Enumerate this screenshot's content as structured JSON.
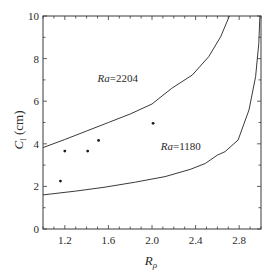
{
  "chart_data": {
    "type": "line",
    "title": "",
    "xlabel": "R_ρ",
    "xlabel_main": "R",
    "xlabel_sub": "ρ",
    "ylabel": "C_l (cm)",
    "ylabel_main": "C",
    "ylabel_sub": "l",
    "ylabel_unit": " (cm)",
    "xlim": [
      1.0,
      3.0
    ],
    "ylim": [
      0,
      10
    ],
    "xticks": [
      1.2,
      1.6,
      2.0,
      2.4,
      2.8
    ],
    "xtick_labels": [
      "1.2",
      "1.6",
      "2.0",
      "2.4",
      "2.8"
    ],
    "yticks": [
      0,
      2,
      4,
      6,
      8,
      10
    ],
    "ytick_labels": [
      "0",
      "2",
      "4",
      "6",
      "8",
      "10"
    ],
    "x_minor_step": 0.1,
    "y_minor_step": 1,
    "grid": false,
    "legend": null,
    "series": [
      {
        "name": "Ra=2204",
        "style": "line",
        "x": [
          1.0,
          1.2,
          1.4,
          1.6,
          1.8,
          2.0,
          2.18,
          2.37,
          2.52,
          2.63,
          2.71
        ],
        "y": [
          3.82,
          4.2,
          4.6,
          5.0,
          5.4,
          5.87,
          6.6,
          7.23,
          8.09,
          9.03,
          10.0
        ]
      },
      {
        "name": "Ra=1180",
        "style": "line",
        "x": [
          1.0,
          1.3,
          1.56,
          1.85,
          2.12,
          2.35,
          2.49,
          2.6,
          2.67,
          2.79,
          2.89,
          2.95,
          2.98,
          2.99
        ],
        "y": [
          1.6,
          1.78,
          1.96,
          2.2,
          2.46,
          2.8,
          3.08,
          3.47,
          3.63,
          4.18,
          5.59,
          7.15,
          8.72,
          10.0
        ]
      },
      {
        "name": "measurements",
        "style": "scatter",
        "x": [
          1.16,
          1.2,
          1.41,
          1.51,
          2.01
        ],
        "y": [
          2.25,
          3.66,
          3.66,
          4.16,
          4.96
        ]
      }
    ],
    "annotations": [
      {
        "text": "Ra=2204",
        "italic_part": "Ra",
        "value_part": "=2204",
        "x": 1.5,
        "y": 6.9
      },
      {
        "text": "Ra=1180",
        "italic_part": "Ra",
        "value_part": "=1180",
        "x": 2.08,
        "y": 3.7
      }
    ]
  }
}
